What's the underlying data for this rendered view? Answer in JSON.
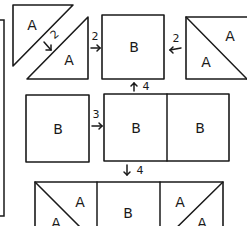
{
  "diagram": {
    "type": "quilt-block-assembly",
    "stroke_color": "#1a1a1a",
    "background": "#ffffff",
    "pieces": {
      "top_left_upper_triangle": {
        "label": "A"
      },
      "top_left_lower_triangle": {
        "label": "A"
      },
      "top_middle_square": {
        "label": "B"
      },
      "top_right_square_upper": {
        "label": "A"
      },
      "top_right_square_lower": {
        "label": "A"
      },
      "middle_left_square": {
        "label": "B"
      },
      "middle_right_left_square": {
        "label": "B"
      },
      "middle_right_right_square": {
        "label": "B"
      },
      "bottom_left_upper": {
        "label": "A"
      },
      "bottom_left_lower": {
        "label": "A"
      },
      "bottom_middle": {
        "label": "B"
      },
      "bottom_right_upper": {
        "label": "A"
      },
      "bottom_right_lower": {
        "label": "A"
      }
    },
    "steps": {
      "step_diagonal": {
        "number": "2",
        "arrow": "down-right"
      },
      "step_top_left_join": {
        "number": "2",
        "arrow": "right"
      },
      "step_top_right_join": {
        "number": "2",
        "arrow": "left"
      },
      "step_middle_join": {
        "number": "3",
        "arrow": "right"
      },
      "step_up": {
        "number": "4",
        "arrow": "up"
      },
      "step_down": {
        "number": "4",
        "arrow": "down"
      }
    }
  }
}
